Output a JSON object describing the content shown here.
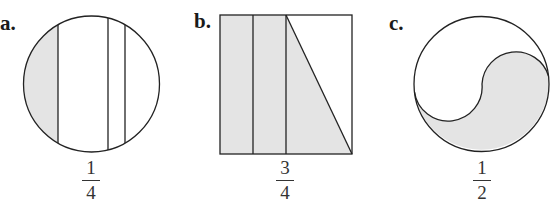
{
  "colors": {
    "stroke": "#222222",
    "shade": "#e4e4e4",
    "background": "#ffffff"
  },
  "figures": [
    {
      "label": "a.",
      "shape": "circle",
      "fraction": {
        "numerator": "1",
        "denominator": "4"
      }
    },
    {
      "label": "b.",
      "shape": "square",
      "fraction": {
        "numerator": "3",
        "denominator": "4"
      }
    },
    {
      "label": "c.",
      "shape": "circle-yin-yang",
      "fraction": {
        "numerator": "1",
        "denominator": "2"
      }
    }
  ]
}
